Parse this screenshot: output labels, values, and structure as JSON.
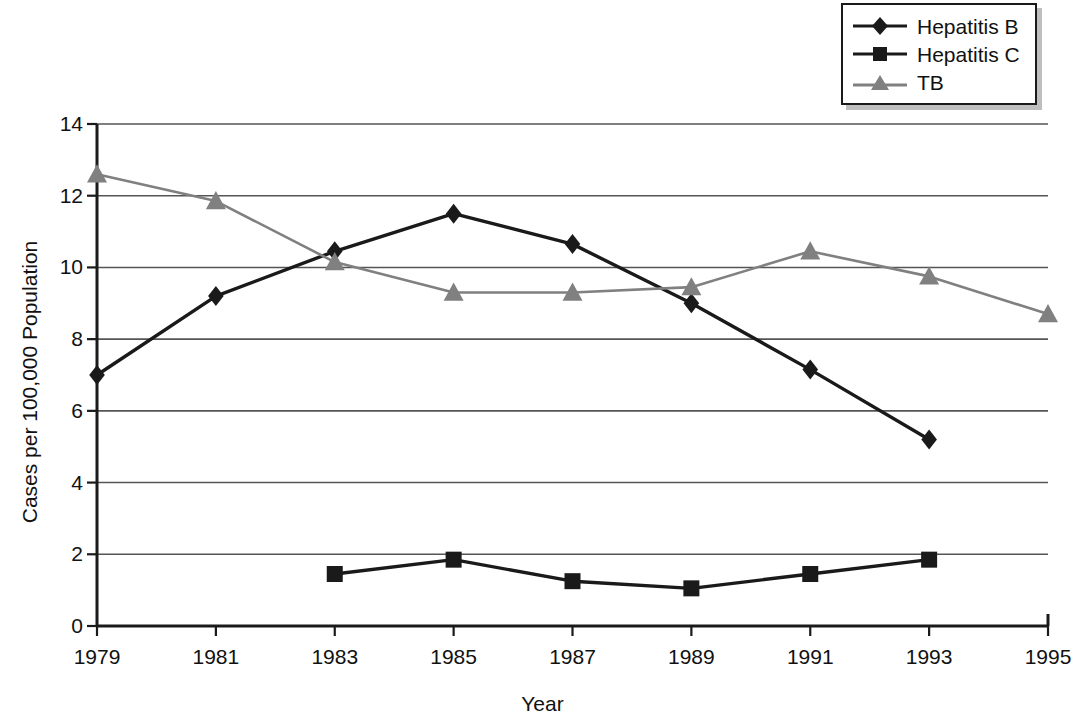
{
  "chart_data": {
    "type": "line",
    "title": "",
    "subtitle": "",
    "xlabel": "Year",
    "ylabel": "Cases per 100,000 Population",
    "x": [
      1979,
      1981,
      1983,
      1985,
      1987,
      1989,
      1991,
      1993,
      1995
    ],
    "xtick_labels": [
      "1979",
      "1981",
      "1983",
      "1985",
      "1987",
      "1989",
      "1991",
      "1993",
      "1995"
    ],
    "ytick_labels": [
      "0",
      "2",
      "4",
      "6",
      "8",
      "10",
      "12",
      "14"
    ],
    "yticks": [
      0,
      2,
      4,
      6,
      8,
      10,
      12,
      14
    ],
    "xlim": [
      1979,
      1995
    ],
    "ylim": [
      0,
      14
    ],
    "grid": "horizontal",
    "legend_position": "top-right",
    "series": [
      {
        "name": "Hepatitis B",
        "marker": "diamond",
        "color": "#1a1a1a",
        "x": [
          1979,
          1981,
          1983,
          1985,
          1987,
          1989,
          1991,
          1993
        ],
        "values": [
          7.0,
          9.2,
          10.45,
          11.5,
          10.65,
          9.0,
          7.15,
          5.2
        ]
      },
      {
        "name": "Hepatitis C",
        "marker": "square",
        "color": "#1a1a1a",
        "x": [
          1983,
          1985,
          1987,
          1989,
          1991,
          1993
        ],
        "values": [
          1.45,
          1.85,
          1.25,
          1.05,
          1.45,
          1.85
        ]
      },
      {
        "name": "TB",
        "marker": "triangle",
        "color": "#808080",
        "x": [
          1979,
          1981,
          1983,
          1985,
          1987,
          1989,
          1991,
          1993,
          1995
        ],
        "values": [
          12.6,
          11.85,
          10.15,
          9.3,
          9.3,
          9.45,
          10.45,
          9.75,
          8.7
        ]
      }
    ]
  },
  "legend": {
    "entries": [
      {
        "label": "Hepatitis B"
      },
      {
        "label": "Hepatitis C"
      },
      {
        "label": "TB"
      }
    ]
  },
  "colors": {
    "axis": "#1a1a1a",
    "grid": "#555555",
    "hepatitis_b": "#1a1a1a",
    "hepatitis_c": "#1a1a1a",
    "tb": "#808080",
    "legend_shadow": "#bfbfbf",
    "background": "#ffffff"
  }
}
